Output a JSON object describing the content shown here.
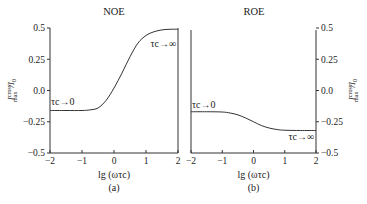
{
  "chart_data": [
    {
      "type": "line",
      "title": "NOE",
      "panel_label": "(a)",
      "xlabel": "lg (ωτc)",
      "ylabel": "I_max^cross / I_0",
      "ylabel_main": "I",
      "ylabel_sup": "cross",
      "ylabel_sub": "max",
      "ylabel_tail": "/I",
      "ylabel_tail_sub": "0",
      "xlim": [
        -2,
        2
      ],
      "ylim": [
        -0.5,
        0.5
      ],
      "xticks": [
        -2,
        -1,
        0,
        1,
        2
      ],
      "xtick_labels": [
        "−2",
        "−1",
        "0",
        "1",
        "2"
      ],
      "yticks": [
        0.5,
        0.25,
        0.0,
        -0.25,
        -0.5
      ],
      "ytick_labels": [
        "0.5",
        "0.25",
        "0.0",
        "−0.25",
        "−0.5"
      ],
      "y_axis_side": "left",
      "grid": false,
      "annotations": [
        {
          "text": "τc→0",
          "x": -2.0,
          "y": -0.15,
          "anchor": "start",
          "where": "above-curve"
        },
        {
          "text": "τc→∞",
          "x": 1.97,
          "y": 0.42,
          "anchor": "end",
          "where": "below-curve"
        }
      ],
      "series": [
        {
          "name": "NOE",
          "x": [
            -2.0,
            -1.5,
            -1.0,
            -0.75,
            -0.5,
            -0.25,
            0.0,
            0.25,
            0.5,
            0.75,
            1.0,
            1.25,
            1.5,
            1.75,
            2.0
          ],
          "y": [
            -0.16,
            -0.16,
            -0.16,
            -0.155,
            -0.14,
            -0.08,
            0.02,
            0.14,
            0.27,
            0.38,
            0.44,
            0.47,
            0.485,
            0.49,
            0.49
          ]
        }
      ]
    },
    {
      "type": "line",
      "title": "ROE",
      "panel_label": "(b)",
      "xlabel": "lg (ωτc)",
      "ylabel": "I_max^cross / I_0",
      "ylabel_main": "I",
      "ylabel_sup": "cross",
      "ylabel_sub": "max",
      "ylabel_tail": "/I",
      "ylabel_tail_sub": "0",
      "xlim": [
        -2,
        2
      ],
      "ylim": [
        -0.5,
        0.5
      ],
      "xticks": [
        -2,
        -1,
        0,
        1,
        2
      ],
      "xtick_labels": [
        "−2",
        "−1",
        "0",
        "1",
        "2"
      ],
      "yticks": [
        0.5,
        0.25,
        0.0,
        -0.25,
        -0.5
      ],
      "ytick_labels": [
        "0.5",
        "0.25",
        "0.0",
        "−0.25",
        "−0.5"
      ],
      "y_axis_side": "right",
      "grid": false,
      "annotations": [
        {
          "text": "τc→0",
          "x": -2.0,
          "y": -0.17,
          "anchor": "start",
          "where": "above-curve"
        },
        {
          "text": "τc→∞",
          "x": 1.97,
          "y": -0.32,
          "anchor": "end",
          "where": "below-curve"
        }
      ],
      "series": [
        {
          "name": "ROE",
          "x": [
            -2.0,
            -1.5,
            -1.0,
            -0.75,
            -0.5,
            -0.25,
            0.0,
            0.25,
            0.5,
            0.75,
            1.0,
            1.5,
            2.0
          ],
          "y": [
            -0.17,
            -0.17,
            -0.172,
            -0.18,
            -0.195,
            -0.22,
            -0.25,
            -0.28,
            -0.3,
            -0.312,
            -0.318,
            -0.32,
            -0.32
          ]
        }
      ]
    }
  ]
}
